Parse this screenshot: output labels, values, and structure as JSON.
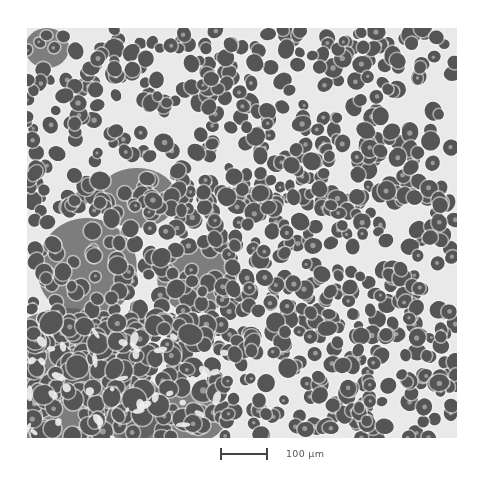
{
  "figure": {
    "type": "grayscale-micrograph",
    "scale_bar": {
      "label": "100 µm",
      "length_px": 48
    }
  },
  "texture": {
    "seed": 7,
    "width": 430,
    "height": 410,
    "background": "#e9e9e9",
    "cell_color": "#545454",
    "dense_color": "#5a5a5a",
    "halo_color": "#f4f4f4",
    "nucleus_color": "#9a9a9a",
    "regions": [
      {
        "name": "sparse-top",
        "x": 0,
        "y": 0,
        "w": 430,
        "h": 180,
        "density": 0.0048,
        "r_min": 5,
        "r_max": 9
      },
      {
        "name": "mid",
        "x": 0,
        "y": 160,
        "w": 430,
        "h": 150,
        "density": 0.0058,
        "r_min": 5,
        "r_max": 9
      },
      {
        "name": "dense-lower-left",
        "x": 0,
        "y": 290,
        "w": 200,
        "h": 120,
        "density": 0.0085,
        "r_min": 6,
        "r_max": 11
      },
      {
        "name": "lower-right",
        "x": 200,
        "y": 300,
        "w": 230,
        "h": 110,
        "density": 0.0055,
        "r_min": 5,
        "r_max": 9
      }
    ],
    "dark_blobs": [
      {
        "cx": 20,
        "cy": 20,
        "rx": 22,
        "ry": 20
      },
      {
        "cx": 40,
        "cy": 320,
        "rx": 60,
        "ry": 40
      },
      {
        "cx": 60,
        "cy": 380,
        "rx": 80,
        "ry": 45
      },
      {
        "cx": 140,
        "cy": 390,
        "rx": 60,
        "ry": 30
      },
      {
        "cx": 60,
        "cy": 240,
        "rx": 50,
        "ry": 50
      },
      {
        "cx": 170,
        "cy": 250,
        "rx": 40,
        "ry": 35
      },
      {
        "cx": 110,
        "cy": 170,
        "rx": 40,
        "ry": 30
      }
    ]
  }
}
